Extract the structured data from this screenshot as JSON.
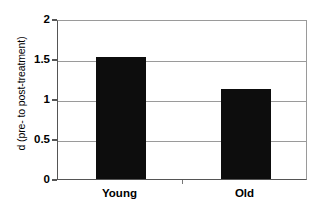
{
  "chart_data": {
    "type": "bar",
    "title": "",
    "xlabel": "",
    "ylabel": "d (pre- to post-treatment)",
    "categories": [
      "Young",
      "Old"
    ],
    "values": [
      1.52,
      1.12
    ],
    "ylim": [
      0,
      2
    ],
    "yticks": [
      0,
      0.5,
      1,
      1.5,
      2
    ],
    "ytick_labels": [
      "0",
      "0.5",
      "1",
      "1.5",
      "2"
    ],
    "grid": true,
    "legend": false,
    "bar_color": "#0d0d0d",
    "gridline_color": "#9a9a9a",
    "axis_color": "#555555",
    "background_color": "#ffffff"
  }
}
